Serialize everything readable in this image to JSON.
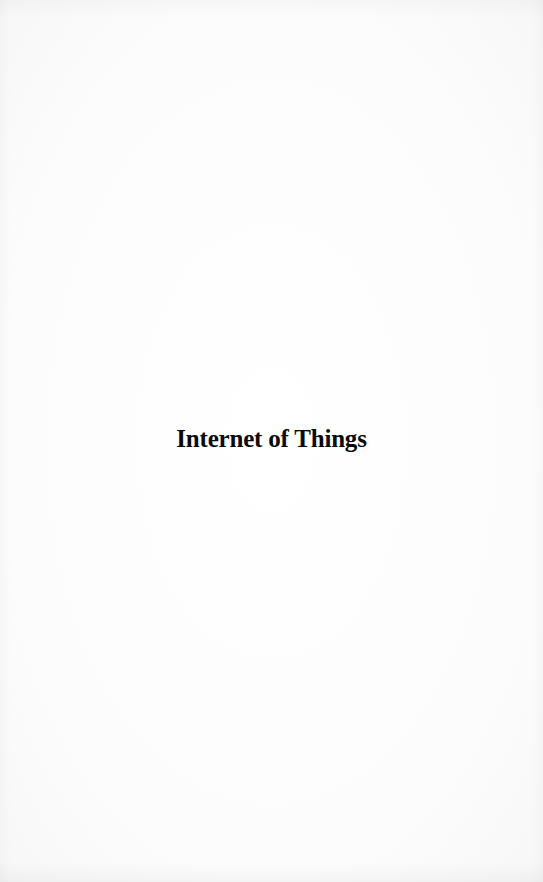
{
  "page": {
    "type": "half-title page",
    "title": "Internet of Things"
  }
}
